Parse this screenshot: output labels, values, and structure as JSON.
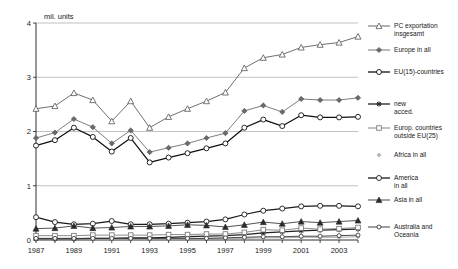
{
  "chart_data": {
    "type": "line",
    "title": "",
    "subtitle": "",
    "xlabel": "",
    "ylabel": "mil. units",
    "ylim": [
      0,
      4
    ],
    "xlim": [
      1987,
      2004
    ],
    "grid": true,
    "legend_position": "right",
    "yticks": [
      "0",
      "1",
      "2",
      "3",
      "4"
    ],
    "ytick_values": [
      0,
      1,
      2,
      3,
      4
    ],
    "x": [
      1987,
      1988,
      1989,
      1990,
      1991,
      1992,
      1993,
      1994,
      1995,
      1996,
      1997,
      1998,
      1999,
      2000,
      2001,
      2002,
      2003,
      2004
    ],
    "xticks": [
      "1987",
      "",
      "1989",
      "",
      "1991",
      "",
      "1993",
      "",
      "1995",
      "",
      "1997",
      "",
      "1999",
      "",
      "2001",
      "",
      "2003",
      ""
    ],
    "xtick_labels_shown": [
      "1987",
      "1989",
      "1991",
      "1993",
      "1995",
      "1997",
      "1999",
      "2001",
      "2003"
    ],
    "series": [
      {
        "name": "PC exportation insgesamt",
        "marker": "triangle-up-open",
        "color": "#555555",
        "values": [
          2.42,
          2.47,
          2.71,
          2.58,
          2.19,
          2.56,
          2.07,
          2.27,
          2.42,
          2.56,
          2.72,
          3.17,
          3.36,
          3.42,
          3.55,
          3.6,
          3.64,
          3.75
        ]
      },
      {
        "name": "Europe in all",
        "marker": "diamond-filled",
        "color": "#666666",
        "values": [
          1.88,
          1.98,
          2.23,
          2.08,
          1.78,
          2.02,
          1.62,
          1.7,
          1.78,
          1.88,
          1.97,
          2.38,
          2.48,
          2.36,
          2.6,
          2.58,
          2.58,
          2.62
        ]
      },
      {
        "name": "EU(15)-countries",
        "marker": "circle-open",
        "color": "#111111",
        "values": [
          1.74,
          1.84,
          2.07,
          1.9,
          1.63,
          1.88,
          1.43,
          1.52,
          1.6,
          1.69,
          1.78,
          2.07,
          2.22,
          2.1,
          2.3,
          2.26,
          2.26,
          2.27
        ]
      },
      {
        "name": "new acced.",
        "marker": "star-filled",
        "color": "#222222",
        "values": [
          0.02,
          0.02,
          0.02,
          0.03,
          0.03,
          0.04,
          0.04,
          0.05,
          0.06,
          0.07,
          0.08,
          0.1,
          0.13,
          0.15,
          0.17,
          0.18,
          0.19,
          0.2
        ]
      },
      {
        "name": "Europ. countries outside EU(25)",
        "marker": "square-open",
        "color": "#777777",
        "values": [
          0.08,
          0.08,
          0.08,
          0.09,
          0.09,
          0.09,
          0.09,
          0.1,
          0.1,
          0.11,
          0.11,
          0.14,
          0.19,
          0.18,
          0.22,
          0.2,
          0.21,
          0.23
        ]
      },
      {
        "name": "Africa in all",
        "marker": "circle-small-grey",
        "color": "#9a9a9a",
        "values": [
          0.02,
          0.02,
          0.02,
          0.02,
          0.02,
          0.02,
          0.02,
          0.02,
          0.02,
          0.03,
          0.03,
          0.03,
          0.04,
          0.04,
          0.05,
          0.05,
          0.05,
          0.06
        ]
      },
      {
        "name": "America in all",
        "marker": "circle-open-bold",
        "color": "#1a1a1a",
        "values": [
          0.42,
          0.33,
          0.29,
          0.3,
          0.35,
          0.29,
          0.29,
          0.3,
          0.32,
          0.34,
          0.38,
          0.47,
          0.54,
          0.58,
          0.62,
          0.63,
          0.63,
          0.62
        ]
      },
      {
        "name": "Asia in all",
        "marker": "triangle-up-filled",
        "color": "#333333",
        "values": [
          0.21,
          0.22,
          0.26,
          0.22,
          0.23,
          0.25,
          0.25,
          0.26,
          0.28,
          0.27,
          0.24,
          0.28,
          0.33,
          0.3,
          0.34,
          0.32,
          0.34,
          0.36
        ]
      },
      {
        "name": "Australia and Oceania",
        "marker": "circle-open-small",
        "color": "#2b2b2b",
        "values": [
          0.03,
          0.03,
          0.03,
          0.03,
          0.03,
          0.03,
          0.03,
          0.03,
          0.03,
          0.03,
          0.04,
          0.05,
          0.06,
          0.06,
          0.07,
          0.07,
          0.08,
          0.09
        ]
      }
    ],
    "legend_entries": [
      {
        "label_line1": "PC exportation",
        "label_line2": "insgesamt"
      },
      {
        "label_line1": "Europe in all",
        "label_line2": ""
      },
      {
        "label_line1": "EU(15)-countries",
        "label_line2": ""
      },
      {
        "label_line1": "new",
        "label_line2": "acced."
      },
      {
        "label_line1": "Europ. countries",
        "label_line2": "outside  EU(25)"
      },
      {
        "label_line1": "Africa in all",
        "label_line2": ""
      },
      {
        "label_line1": "America",
        "label_line2": "in all"
      },
      {
        "label_line1": "Asia in all",
        "label_line2": ""
      },
      {
        "label_line1": "Australia and",
        "label_line2": "Oceania"
      }
    ]
  }
}
